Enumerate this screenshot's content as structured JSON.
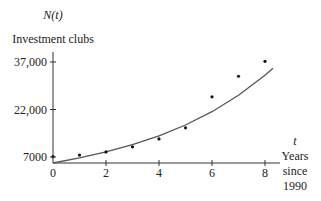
{
  "chart_data": {
    "type": "scatter",
    "title": "",
    "ylabel_var": "N(t)",
    "ylabel": "Investment clubs",
    "xlabel_var": "t",
    "xlabel_lines": [
      "Years",
      "since",
      "1990"
    ],
    "x_ticks": [
      0,
      2,
      4,
      6,
      8
    ],
    "x_tick_labels": [
      "0",
      "2",
      "4",
      "6",
      "8"
    ],
    "y_ticks": [
      7000,
      22000,
      37000
    ],
    "y_tick_labels": [
      "7000",
      "22,000",
      "37,000"
    ],
    "xlim": [
      0,
      8.5
    ],
    "ylim": [
      5000,
      40000
    ],
    "grid": false,
    "legend": null,
    "series": [
      {
        "name": "Data points",
        "kind": "scatter",
        "x": [
          0,
          1,
          2,
          3,
          4,
          5,
          6,
          7,
          8
        ],
        "y": [
          7100,
          7600,
          8600,
          10200,
          12700,
          16200,
          26000,
          32500,
          37200
        ]
      },
      {
        "name": "Fitted curve",
        "kind": "line",
        "x": [
          0,
          1,
          2,
          3,
          4,
          5,
          6,
          7,
          8,
          8.3
        ],
        "y": [
          5100,
          6700,
          8600,
          10900,
          13700,
          17100,
          21300,
          26500,
          32800,
          35000
        ]
      }
    ]
  },
  "colors": {
    "axis": "#333333",
    "curve": "#555555",
    "points": "#111111"
  }
}
